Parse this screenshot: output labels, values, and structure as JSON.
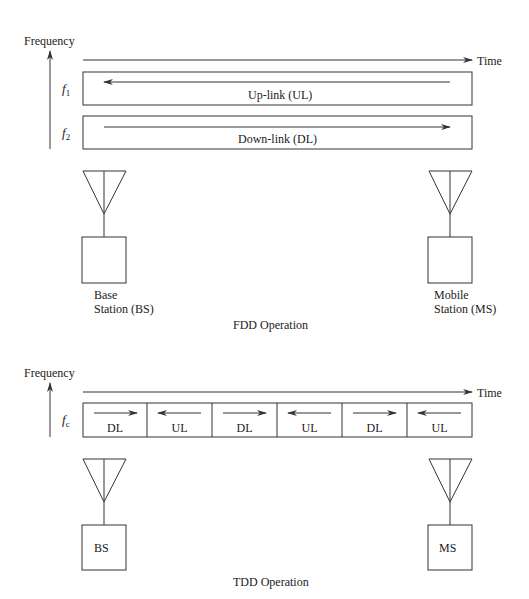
{
  "fdd": {
    "axis_label": "Frequency",
    "time_label": "Time",
    "channels": [
      {
        "freq_symbol": "f",
        "freq_sub": "1",
        "label": "Up-link (UL)",
        "direction": "left"
      },
      {
        "freq_symbol": "f",
        "freq_sub": "2",
        "label": "Down-link (DL)",
        "direction": "right"
      }
    ],
    "base_station": {
      "line1": "Base",
      "line2": "Station (BS)"
    },
    "mobile_station": {
      "line1": "Mobile",
      "line2": "Station (MS)"
    },
    "caption": "FDD Operation"
  },
  "tdd": {
    "axis_label": "Frequency",
    "time_label": "Time",
    "freq_symbol": "f",
    "freq_sub": "c",
    "slots": [
      {
        "label": "DL",
        "direction": "right"
      },
      {
        "label": "UL",
        "direction": "left"
      },
      {
        "label": "DL",
        "direction": "right"
      },
      {
        "label": "UL",
        "direction": "left"
      },
      {
        "label": "DL",
        "direction": "right"
      },
      {
        "label": "UL",
        "direction": "left"
      }
    ],
    "base_station": {
      "label": "BS"
    },
    "mobile_station": {
      "label": "MS"
    },
    "caption": "TDD Operation"
  }
}
